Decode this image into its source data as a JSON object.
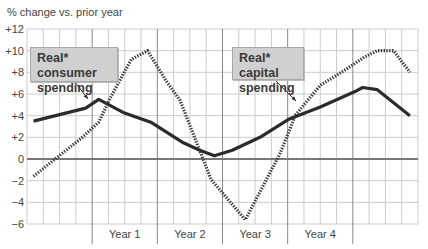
{
  "chart_data": {
    "type": "line",
    "title": "% change vs. prior year",
    "xlabel": "",
    "ylabel": "% change vs. prior year",
    "ylim": [
      -6,
      12
    ],
    "yticks": [
      "+12",
      "+10",
      "+8",
      "+6",
      "+4",
      "+2",
      "0",
      "−2",
      "−4",
      "−6"
    ],
    "ytick_values": [
      12,
      10,
      8,
      6,
      4,
      2,
      0,
      -2,
      -4,
      -6
    ],
    "x_periods": [
      "Year 1",
      "Year 2",
      "Year 3",
      "Year 4"
    ],
    "x_unit": "quarter-grid columns (24 columns; year dividers at columns 4, 8, 12, 16, 20)",
    "grid": true,
    "legend": "callout labels with arrows",
    "series": [
      {
        "name": "Real* consumer spending",
        "style": "solid",
        "x": [
          0.4,
          3.6,
          4.4,
          5.9,
          7.6,
          9.6,
          10.6,
          11.5,
          12.6,
          14.3,
          16.1,
          18.0,
          20.1,
          20.6,
          21.5,
          23.5
        ],
        "values": [
          3.5,
          4.7,
          5.5,
          4.3,
          3.4,
          1.5,
          0.8,
          0.3,
          0.8,
          2.0,
          3.7,
          4.8,
          6.2,
          6.6,
          6.4,
          4.0
        ]
      },
      {
        "name": "Real* capital spending",
        "style": "dotted",
        "x": [
          0.4,
          3.4,
          4.4,
          5.1,
          6.4,
          7.4,
          8.5,
          9.4,
          11.3,
          13.4,
          15.5,
          16.5,
          18.0,
          19.5,
          20.7,
          21.5,
          22.5,
          23.5
        ],
        "values": [
          -1.6,
          2.0,
          3.4,
          5.6,
          9.2,
          10.0,
          7.3,
          5.4,
          -1.9,
          -5.6,
          0.4,
          4.1,
          6.8,
          8.2,
          9.4,
          10.0,
          10.0,
          8.0
        ]
      }
    ],
    "annotations": [
      {
        "text_line1": "Real* consumer",
        "text_line2": "spending",
        "target_series": "Real* consumer spending"
      },
      {
        "text_line1": "Real* capital",
        "text_line2": "spending",
        "target_series": "Real* capital spending"
      }
    ]
  },
  "colors": {
    "consumer_line": "#2b2b2b",
    "capital_line": "#3a3a3a",
    "grid": "#cccccc",
    "axis_zero": "#777777",
    "year_divider": "#888888",
    "callout_fill": "#d0d0d0"
  }
}
